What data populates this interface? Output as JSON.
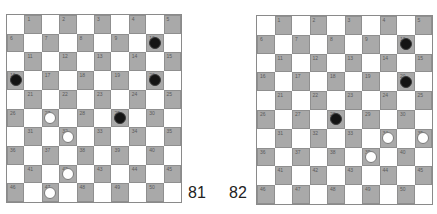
{
  "diagrams": [
    {
      "label": "81",
      "board_size": 10,
      "squares": [
        1,
        2,
        3,
        4,
        5,
        6,
        7,
        8,
        9,
        10,
        11,
        12,
        13,
        14,
        15,
        16,
        17,
        18,
        19,
        20,
        21,
        22,
        23,
        24,
        25,
        26,
        27,
        28,
        29,
        30,
        31,
        32,
        33,
        34,
        35,
        36,
        37,
        38,
        39,
        40,
        41,
        42,
        43,
        44,
        45,
        46,
        47,
        48,
        49,
        50
      ],
      "black_pieces": [
        10,
        16,
        20,
        29
      ],
      "white_pieces": [
        27,
        32,
        42,
        47
      ]
    },
    {
      "label": "82",
      "board_size": 10,
      "squares": [
        1,
        2,
        3,
        4,
        5,
        6,
        7,
        8,
        9,
        10,
        11,
        12,
        13,
        14,
        15,
        16,
        17,
        18,
        19,
        20,
        21,
        22,
        23,
        24,
        25,
        26,
        27,
        28,
        29,
        30,
        31,
        32,
        33,
        34,
        35,
        36,
        37,
        38,
        39,
        40,
        41,
        42,
        43,
        44,
        45,
        46,
        47,
        48,
        49,
        50
      ],
      "black_pieces": [
        10,
        20,
        28
      ],
      "white_pieces": [
        34,
        35,
        39
      ]
    }
  ],
  "colors": {
    "dark_square": "#a9a9a9",
    "light_square": "#ffffff",
    "black_piece": "#141414",
    "white_piece": "#ffffff"
  }
}
